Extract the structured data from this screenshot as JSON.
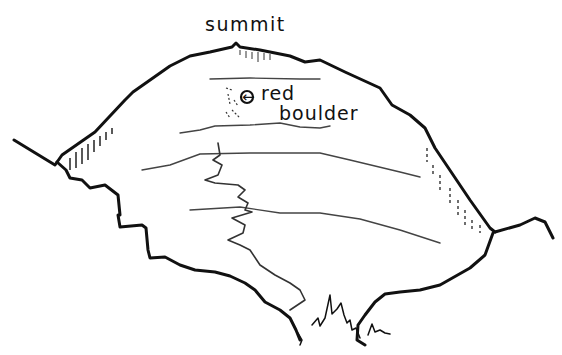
{
  "diagram": {
    "labels": {
      "summit": "summit",
      "marker_arrow": "←",
      "red": "red",
      "boulder": "boulder"
    },
    "colors": {
      "ink": "#111111",
      "contour": "#444444",
      "background": "#ffffff"
    },
    "features": [
      "summit-point",
      "red-boulder-marker",
      "contour-lines",
      "zigzag-path",
      "shaded-slopes",
      "grass-tufts"
    ]
  }
}
